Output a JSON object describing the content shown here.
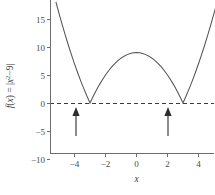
{
  "chart_data": {
    "type": "line",
    "title": "",
    "xlabel": "x",
    "ylabel": "f(x) = |x² − 9|",
    "ylabel_plain": "f(x) = |x2-9|",
    "function_expression": "f(x) = |x^2 - 9|",
    "xlim": [
      -5.2,
      5.2
    ],
    "ylim": [
      -10.8,
      16.5
    ],
    "grid": false,
    "legend": null,
    "xticks": [
      -4,
      -2,
      0,
      2,
      4
    ],
    "xtick_labels": [
      "−4",
      "−2",
      "0",
      "2",
      "4"
    ],
    "yticks": [
      -10,
      -5,
      0,
      5,
      10,
      15
    ],
    "ytick_labels": [
      "−10",
      "−5",
      "0",
      "5",
      "10",
      "15"
    ],
    "series": [
      {
        "name": "f(x) = |x² − 9|",
        "color": "#545454",
        "x": [
          -5.2,
          -5.0,
          -4.8,
          -4.6,
          -4.4,
          -4.2,
          -4.0,
          -3.8,
          -3.6,
          -3.4,
          -3.2,
          -3.0,
          -2.8,
          -2.6,
          -2.4,
          -2.2,
          -2.0,
          -1.8,
          -1.6,
          -1.4,
          -1.2,
          -1.0,
          -0.8,
          -0.6,
          -0.4,
          -0.2,
          0.0,
          0.2,
          0.4,
          0.6,
          0.8,
          1.0,
          1.2,
          1.4,
          1.6,
          1.8,
          2.0,
          2.2,
          2.4,
          2.6,
          2.8,
          3.0,
          3.2,
          3.4,
          3.6,
          3.8,
          4.0,
          4.2,
          4.4,
          4.6,
          4.8,
          5.0,
          5.2
        ],
        "y": [
          18.04,
          16.0,
          14.04,
          12.16,
          10.36,
          8.64,
          7.0,
          5.44,
          3.96,
          2.56,
          1.24,
          0.0,
          1.16,
          2.24,
          3.24,
          4.16,
          5.0,
          5.76,
          6.44,
          7.04,
          7.56,
          8.0,
          8.36,
          8.64,
          8.84,
          8.96,
          9.0,
          8.96,
          8.84,
          8.64,
          8.36,
          8.0,
          7.56,
          7.04,
          6.44,
          5.76,
          5.0,
          4.16,
          3.24,
          2.24,
          1.16,
          0.0,
          1.24,
          2.56,
          3.96,
          5.44,
          7.0,
          8.64,
          10.36,
          12.16,
          14.04,
          16.0,
          18.04
        ]
      }
    ],
    "reference_lines": [
      {
        "name": "y-zero-line",
        "orientation": "horizontal",
        "value": 0,
        "style": "dashed",
        "color": "#3a3a3a"
      }
    ],
    "annotations": [
      {
        "name": "zero-arrow-left",
        "kind": "up-arrow",
        "x": -3,
        "y": 0,
        "label": ""
      },
      {
        "name": "zero-arrow-right",
        "kind": "up-arrow",
        "x": 3,
        "y": 0,
        "label": ""
      }
    ],
    "key_points": {
      "zeros": [
        -3,
        3
      ],
      "maximum": {
        "x": 0,
        "y": 9
      }
    }
  }
}
